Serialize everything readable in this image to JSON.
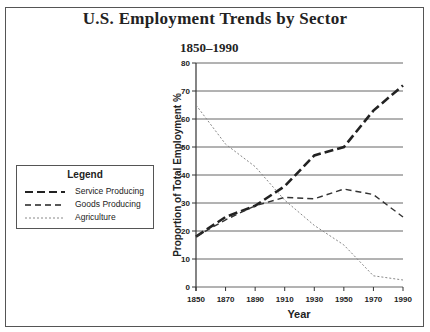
{
  "title": "U.S. Employment Trends by Sector",
  "subtitle": "1850–1990",
  "legend": {
    "title": "Legend",
    "items": [
      {
        "label": "Service Producing",
        "style": "long-dash-thick"
      },
      {
        "label": "Goods Producing",
        "style": "medium-dash"
      },
      {
        "label": "Agriculture",
        "style": "fine-dot"
      }
    ]
  },
  "axes": {
    "xlabel": "Year",
    "ylabel": "Proportion of Total Employment %",
    "xticks": [
      "1850",
      "1870",
      "1890",
      "1910",
      "1930",
      "1950",
      "1970",
      "1990"
    ],
    "yticks": [
      "0",
      "10",
      "20",
      "30",
      "40",
      "50",
      "60",
      "70",
      "80"
    ]
  },
  "chart_data": {
    "type": "line",
    "title": "U.S. Employment Trends by Sector",
    "subtitle": "1850–1990",
    "xlabel": "Year",
    "ylabel": "Proportion of Total Employment %",
    "x": [
      1850,
      1870,
      1890,
      1910,
      1930,
      1950,
      1970,
      1990
    ],
    "xlim": [
      1850,
      1990
    ],
    "ylim": [
      0,
      80
    ],
    "grid": "horizontal",
    "legend_position": "left, outside plot",
    "series": [
      {
        "name": "Service Producing",
        "values": [
          18,
          25,
          29,
          36,
          47,
          50,
          63,
          72
        ]
      },
      {
        "name": "Goods Producing",
        "values": [
          18,
          24,
          29,
          32,
          31.5,
          35,
          33,
          25
        ]
      },
      {
        "name": "Agriculture",
        "values": [
          65,
          51,
          43,
          31,
          22,
          15,
          4,
          2.5
        ]
      }
    ]
  }
}
